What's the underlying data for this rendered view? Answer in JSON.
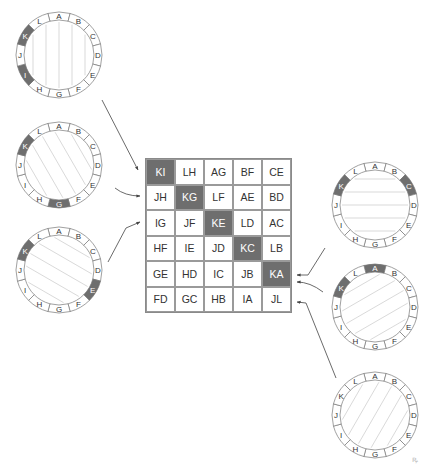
{
  "grid": {
    "rows": [
      [
        "KI",
        "LH",
        "AG",
        "BF",
        "CE"
      ],
      [
        "JH",
        "KG",
        "LF",
        "AE",
        "BD"
      ],
      [
        "IG",
        "JF",
        "KE",
        "LD",
        "AC"
      ],
      [
        "HF",
        "IE",
        "JD",
        "KC",
        "LB"
      ],
      [
        "GE",
        "HD",
        "IC",
        "JB",
        "KA"
      ],
      [
        "FD",
        "GC",
        "HB",
        "IA",
        "JL"
      ]
    ],
    "highlighted": [
      "KI",
      "KG",
      "KE",
      "KC",
      "KA"
    ]
  },
  "ring_labels": [
    "A",
    "B",
    "C",
    "D",
    "E",
    "F",
    "G",
    "H",
    "I",
    "J",
    "K",
    "L"
  ],
  "circles": [
    {
      "id": "c1",
      "cx": 59,
      "cy": 55,
      "highlight": [
        "K",
        "I"
      ],
      "chord_direction": "vertical",
      "target_row": 0
    },
    {
      "id": "c2",
      "cx": 59,
      "cy": 165,
      "highlight": [
        "K",
        "G"
      ],
      "chord_direction": "diag-steep",
      "target_row": 1
    },
    {
      "id": "c3",
      "cx": 59,
      "cy": 270,
      "highlight": [
        "K",
        "E"
      ],
      "chord_direction": "diag-shallow",
      "target_row": 2
    },
    {
      "id": "c4",
      "cx": 375,
      "cy": 205,
      "highlight": [
        "K",
        "C"
      ],
      "chord_direction": "horizontal",
      "target_row": 3
    },
    {
      "id": "c5",
      "cx": 375,
      "cy": 307,
      "highlight": [
        "K",
        "A"
      ],
      "chord_direction": "diag-up-shallow",
      "target_row": 4
    },
    {
      "id": "c6",
      "cx": 375,
      "cy": 415,
      "highlight": [],
      "chord_direction": "diag-up-steep",
      "target_row": 5
    }
  ],
  "colors": {
    "highlight": "#6e6e6e",
    "line": "#555555",
    "ring": "#777777",
    "chord": "#c8c8c8"
  },
  "watermark": "ꝶ"
}
